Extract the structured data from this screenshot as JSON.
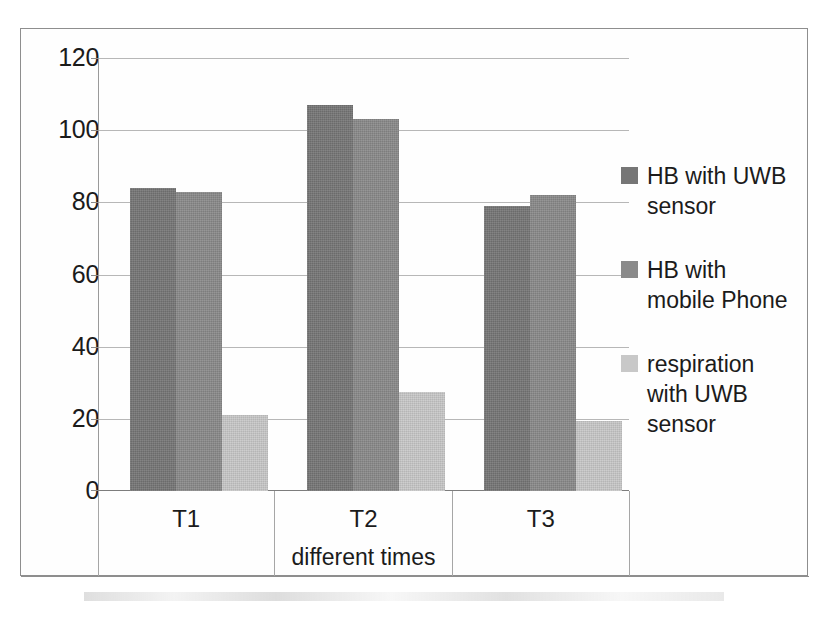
{
  "chart_data": {
    "type": "bar",
    "title": "",
    "xlabel": "different times",
    "ylabel": "",
    "categories": [
      "T1",
      "T2",
      "T3"
    ],
    "series": [
      {
        "name": "HB  with UWB\nsensor",
        "values": [
          84,
          107,
          79
        ],
        "color": "#767676"
      },
      {
        "name": " HB  with\nmobile Phone",
        "values": [
          83,
          103,
          82
        ],
        "color": "#8a8a8a"
      },
      {
        "name": "respiration\nwith UWB\nsensor",
        "values": [
          21,
          27.5,
          19.5
        ],
        "color": "#c8c8c8"
      }
    ],
    "ylim": [
      0,
      120
    ],
    "ytick_step": 20,
    "yticks": [
      "120",
      "100",
      "80",
      "60",
      "40",
      "20",
      "0"
    ],
    "grid": true,
    "legend_position": "right"
  },
  "legend": {
    "entries": [
      {
        "label": "HB  with UWB\nsensor"
      },
      {
        "label": " HB  with\nmobile Phone"
      },
      {
        "label": "respiration\nwith UWB\nsensor"
      }
    ]
  },
  "axis": {
    "x_title": "different times",
    "categories": [
      "T1",
      "T2",
      "T3"
    ],
    "y_ticks": [
      "120",
      "100",
      "80",
      "60",
      "40",
      "20",
      "0"
    ]
  }
}
